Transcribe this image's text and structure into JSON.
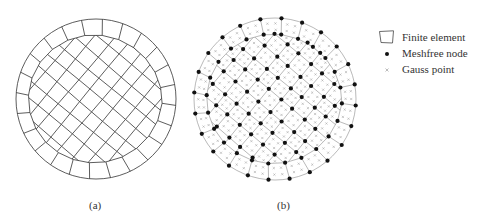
{
  "figure": {
    "panels": [
      {
        "id": "a",
        "label": "(a)",
        "cx": 96,
        "cy": 99,
        "r": 80,
        "shows_nodes": false,
        "shows_gauss": false
      },
      {
        "id": "b",
        "label": "(b)",
        "cx": 275,
        "cy": 99,
        "r": 81,
        "shows_nodes": true,
        "shows_gauss": true
      }
    ],
    "legend": {
      "items": [
        {
          "symbol": "quad-element",
          "label": "Finite element"
        },
        {
          "symbol": "black-dot",
          "label": "Meshfree node"
        },
        {
          "symbol": "gray-cross",
          "label": "Gauss point"
        }
      ]
    },
    "colors": {
      "mesh_a": "#333333",
      "mesh_b": "#8a8a8a",
      "node": "#111111",
      "gauss": "#9a9a9a"
    },
    "mesh": {
      "outer_ring_segments": 24,
      "inner_ring_radius_frac": 0.82,
      "core_grid_angle_deg": 40,
      "core_grid_spacing_frac": 0.19
    }
  }
}
